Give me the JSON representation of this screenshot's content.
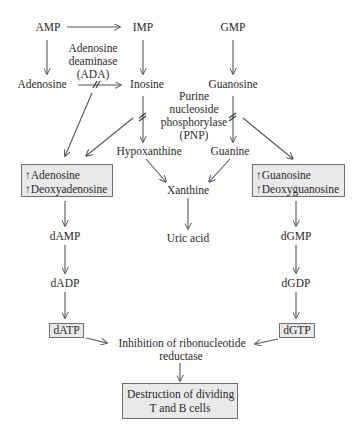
{
  "diagram": {
    "nodes": {
      "amp": "AMP",
      "imp": "IMP",
      "gmp": "GMP",
      "adenosine": "Adenosine",
      "inosine": "Inosine",
      "guanosine": "Guanosine",
      "hypoxanthine": "Hypoxanthine",
      "guanine": "Guanine",
      "xanthine": "Xanthine",
      "uric_acid": "Uric acid",
      "damp": "dAMP",
      "dadp": "dADP",
      "datp": "dATP",
      "dgmp": "dGMP",
      "dgdp": "dGDP",
      "dgtp": "dGTP"
    },
    "enzymes": {
      "ada": [
        "Adenosine",
        "deaminase",
        "(ADA)"
      ],
      "pnp": [
        "Purine",
        "nucleoside",
        "phosphorylase",
        "(PNP)"
      ]
    },
    "boxes": {
      "left": [
        "↑Adenosine",
        "↑Deoxyadenosine"
      ],
      "right": [
        "↑Guanosine",
        "↑Deoxyguanosine"
      ],
      "outcome": [
        "Destruction of dividing",
        "T and B cells"
      ]
    },
    "inhibition": [
      "Inhibition of ribonucleotide",
      "reductase"
    ],
    "blocked_marker": "double-slash",
    "colors": {
      "text": "#2a2a2a",
      "arrow": "#555555",
      "box_fill": "#e9e9e9",
      "box_border": "#6e6e6e"
    }
  }
}
